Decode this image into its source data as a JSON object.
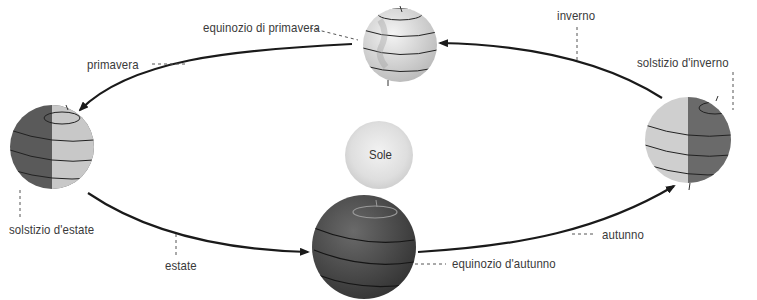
{
  "diagram": {
    "title": "",
    "center": {
      "label": "Sole"
    },
    "positions": [
      {
        "id": "equinozio-primavera",
        "label": "equinozio di primavera"
      },
      {
        "id": "solstizio-estate",
        "label": "solstizio d'estate"
      },
      {
        "id": "equinozio-autunno",
        "label": "equinozio d'autunno"
      },
      {
        "id": "solstizio-inverno",
        "label": "solstizio d'inverno"
      }
    ],
    "seasons": [
      {
        "id": "primavera",
        "label": "primavera"
      },
      {
        "id": "estate",
        "label": "estate"
      },
      {
        "id": "autunno",
        "label": "autunno"
      },
      {
        "id": "inverno",
        "label": "inverno"
      }
    ],
    "colors": {
      "orbit": "#1a1a1a",
      "sun": "#e2e2e2",
      "globe_light": "#d8d8d8",
      "globe_dark": "#4a4a4a",
      "leader": "#555555",
      "text": "#3a3a3a"
    }
  }
}
